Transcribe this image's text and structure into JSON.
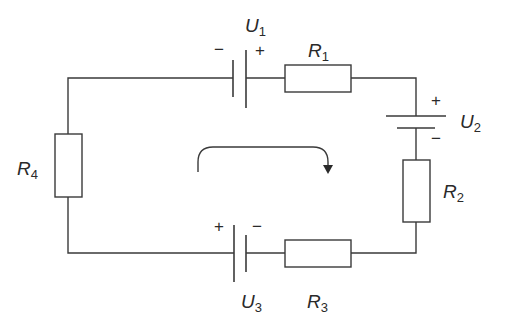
{
  "diagram": {
    "type": "circuit-schematic",
    "colors": {
      "line": "#3a3a3a",
      "text": "#2a2a2a",
      "background": "#ffffff"
    },
    "components": {
      "U1": {
        "label": "U",
        "sub": "1",
        "plus": "+",
        "minus": "−"
      },
      "U2": {
        "label": "U",
        "sub": "2",
        "plus": "+",
        "minus": "−"
      },
      "U3": {
        "label": "U",
        "sub": "3",
        "plus": "+",
        "minus": "−"
      },
      "R1": {
        "label": "R",
        "sub": "1"
      },
      "R2": {
        "label": "R",
        "sub": "2"
      },
      "R3": {
        "label": "R",
        "sub": "3"
      },
      "R4": {
        "label": "R",
        "sub": "4"
      }
    },
    "loop_direction": "clockwise"
  }
}
